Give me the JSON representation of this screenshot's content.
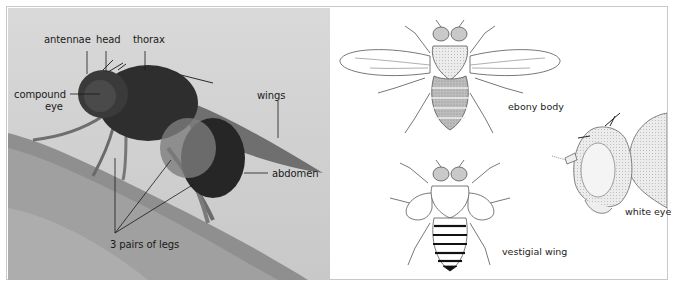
{
  "figure": {
    "photo_panel": {
      "subject": "fruit fly photograph",
      "labels": {
        "antennae": "antennae",
        "head": "head",
        "thorax": "thorax",
        "compound_eye_line1": "compound",
        "compound_eye_line2": "eye",
        "wings": "wings",
        "abdomen": "abdomen",
        "legs": "3 pairs of legs"
      }
    },
    "illustration_panel": {
      "labels": {
        "ebony_body": "ebony body",
        "vestigial_wing": "vestigial wing",
        "white_eye": "white eye"
      }
    },
    "colors": {
      "photo_background": "#d2d2d2",
      "fly_body": "#2b2b2b",
      "leader_line": "#1a1a1a",
      "illustration_stroke": "#555555",
      "ebony_fill": "#9a9a9a",
      "eye_fill": "#bdbdbd",
      "border": "#c9c9c9"
    }
  }
}
